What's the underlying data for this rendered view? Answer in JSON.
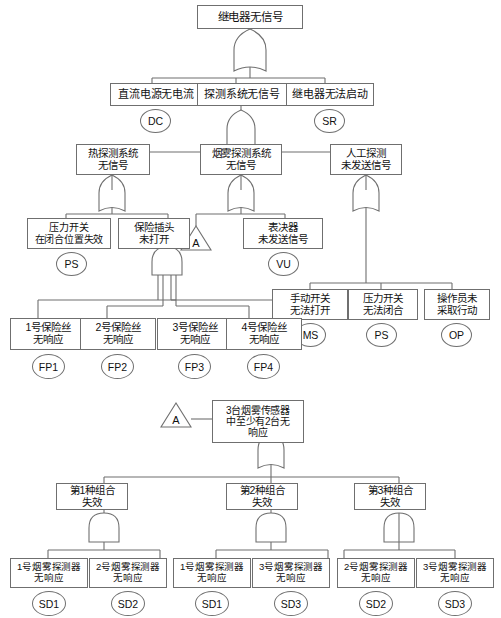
{
  "diagram": {
    "title": "继电器无信号",
    "type": "fault-tree",
    "gate_types": {
      "or": "OR",
      "and": "AND",
      "transfer": "TRANSFER"
    },
    "nodes": [
      {
        "id": "top",
        "label": "继电器无信号",
        "gate": "OR"
      },
      {
        "id": "l2a",
        "label": "直流电源无电流",
        "code": "DC",
        "gate": ""
      },
      {
        "id": "l2b",
        "label": "探测系统无信号",
        "gate": "OR"
      },
      {
        "id": "l2c",
        "label": "继电器无法启动",
        "code": "SR",
        "gate": ""
      },
      {
        "id": "l3a",
        "label": "热探测系统\n无信号",
        "gate": "OR"
      },
      {
        "id": "l3b",
        "label": "烟雾探测系统\n无信号",
        "gate": "OR"
      },
      {
        "id": "l3c",
        "label": "人工探测\n未发送信号",
        "gate": "OR"
      },
      {
        "id": "l4a",
        "label": "压力开关\n在闭合位置失效",
        "code": "PS",
        "gate": ""
      },
      {
        "id": "l4b",
        "label": "保险插头\n未打开",
        "gate": "AND"
      },
      {
        "id": "l4x",
        "label": "A",
        "gate": "TRANSFER"
      },
      {
        "id": "l4c",
        "label": "表决器\n未发送信号",
        "code": "VU",
        "gate": ""
      },
      {
        "id": "l5a",
        "label": "手动开关\n无法打开",
        "code": "MS",
        "gate": ""
      },
      {
        "id": "l5b",
        "label": "压力开关\n无法闭合",
        "code": "PS",
        "gate": ""
      },
      {
        "id": "l5c",
        "label": "操作员未\n采取行动",
        "code": "OP",
        "gate": ""
      },
      {
        "id": "fp1",
        "label": "1号保险丝\n无响应",
        "code": "FP1",
        "gate": ""
      },
      {
        "id": "fp2",
        "label": "2号保险丝\n无响应",
        "code": "FP2",
        "gate": ""
      },
      {
        "id": "fp3",
        "label": "3号保险丝\n无响应",
        "code": "FP3",
        "gate": ""
      },
      {
        "id": "fp4",
        "label": "4号保险丝\n无响应",
        "code": "FP4",
        "gate": ""
      },
      {
        "id": "tA",
        "label": "A",
        "gate": "TRANSFER"
      },
      {
        "id": "sub",
        "label": "3台烟雾传感器\n中至少有2台无\n响应",
        "gate": "OR"
      },
      {
        "id": "c1",
        "label": "第1种组合\n失效",
        "gate": "AND"
      },
      {
        "id": "c2",
        "label": "第2种组合\n失效",
        "gate": "AND"
      },
      {
        "id": "c3",
        "label": "第3种组合\n失效",
        "gate": "AND"
      },
      {
        "id": "sd1a",
        "label": "1号烟雾探测器\n无响应",
        "code": "SD1",
        "gate": ""
      },
      {
        "id": "sd2a",
        "label": "2号烟雾探测器\n无响应",
        "code": "SD2",
        "gate": ""
      },
      {
        "id": "sd1b",
        "label": "1号烟雾探测器\n无响应",
        "code": "SD1",
        "gate": ""
      },
      {
        "id": "sd3a",
        "label": "3号烟雾探测器\n无响应",
        "code": "SD3",
        "gate": ""
      },
      {
        "id": "sd2b",
        "label": "2号烟雾探测器\n无响应",
        "code": "SD2",
        "gate": ""
      },
      {
        "id": "sd3b",
        "label": "3号烟雾探测器\n无响应",
        "code": "SD3",
        "gate": ""
      }
    ],
    "colors": {
      "line": "#6f6f6f",
      "text": "#111111",
      "background": "#ffffff"
    }
  }
}
